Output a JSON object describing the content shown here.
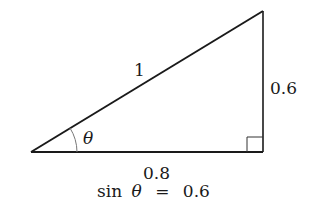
{
  "diagram": {
    "type": "right-triangle",
    "hypotenuse_label": "1",
    "opposite_label": "0.6",
    "adjacent_label": "0.8",
    "angle_label": "θ",
    "caption": {
      "func": "sin",
      "var": "θ",
      "eq": "=",
      "value": "0.6"
    },
    "line_color": "#1a1a1a",
    "arc_color": "#777777"
  }
}
